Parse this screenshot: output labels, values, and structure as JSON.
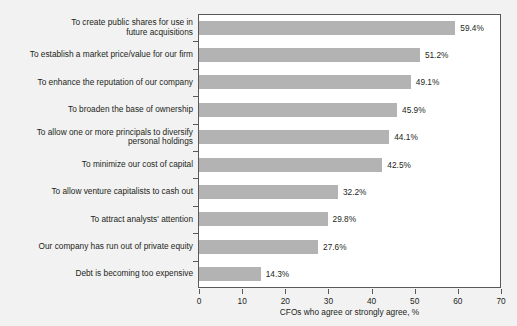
{
  "chart_data": {
    "type": "bar",
    "orientation": "horizontal",
    "title": "",
    "xlabel": "CFOs who agree or strongly agree, %",
    "ylabel": "",
    "xlim": [
      0,
      70
    ],
    "xticks": [
      0,
      10,
      20,
      30,
      40,
      50,
      60,
      70
    ],
    "grid": false,
    "legend": false,
    "bar_color": "#b3b3b3",
    "axis_color": "#58595b",
    "text_color": "#231f20",
    "plot_background": "#ffffff",
    "page_background": "#f2f2f2",
    "categories": [
      "To create public shares for use in\nfuture acquisitions",
      "To establish a market price/value for our firm",
      "To enhance the reputation of our company",
      "To broaden the base of ownership",
      "To allow one or more principals to diversify\npersonal holdings",
      "To minimize our cost of capital",
      "To allow venture capitalists to cash out",
      "To attract analysts' attention",
      "Our company has run out of private equity",
      "Debt is becoming too expensive"
    ],
    "values": [
      59.4,
      51.2,
      49.1,
      45.9,
      44.1,
      42.5,
      32.2,
      29.8,
      27.6,
      14.3
    ],
    "value_labels": [
      "59.4%",
      "51.2%",
      "49.1%",
      "45.9%",
      "44.1%",
      "42.5%",
      "32.2%",
      "29.8%",
      "27.6%",
      "14.3%"
    ],
    "xticklabels": [
      "0",
      "10",
      "20",
      "30",
      "40",
      "50",
      "60",
      "70"
    ]
  }
}
